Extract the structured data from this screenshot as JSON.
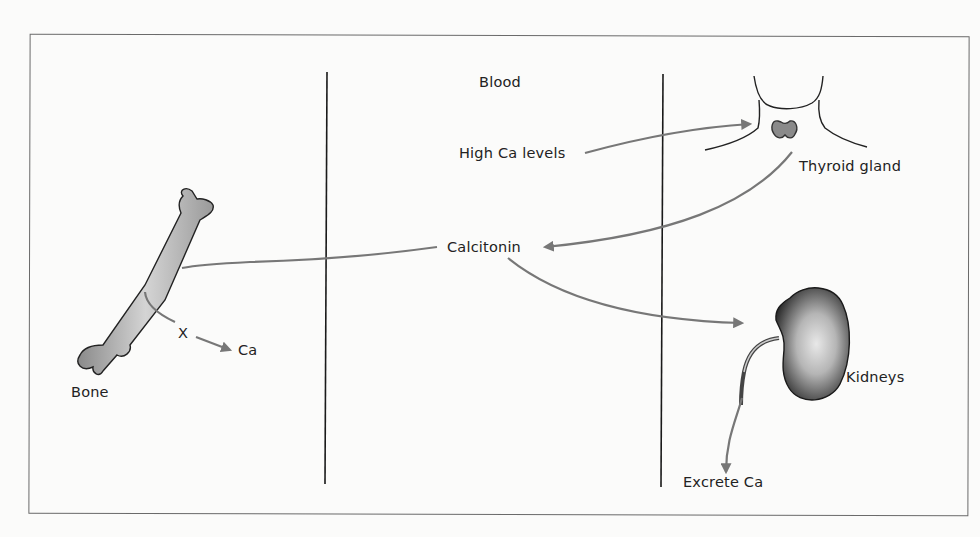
{
  "diagram": {
    "regions": {
      "center_title": "Blood"
    },
    "labels": {
      "high_ca": "High Ca levels",
      "thyroid": "Thyroid gland",
      "calcitonin": "Calcitonin",
      "bone": "Bone",
      "blocked": "X",
      "ca_release": "Ca",
      "kidneys": "Kidneys",
      "excrete": "Excrete Ca"
    },
    "arrow_color": "#777777",
    "line_color": "#1a1a1a",
    "flows": [
      {
        "from": "High Ca levels",
        "to": "Thyroid gland"
      },
      {
        "from": "Thyroid gland",
        "to": "Calcitonin"
      },
      {
        "from": "Calcitonin",
        "to": "Bone"
      },
      {
        "from": "Bone",
        "to": "Ca",
        "blocked": true
      },
      {
        "from": "Calcitonin",
        "to": "Kidneys"
      },
      {
        "from": "Kidneys",
        "to": "Excrete Ca"
      }
    ]
  }
}
